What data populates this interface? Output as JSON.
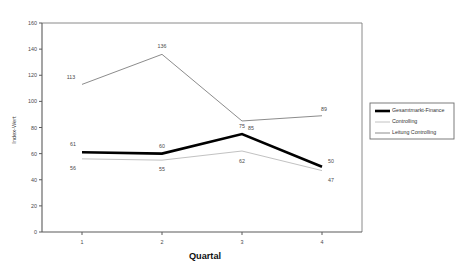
{
  "chart_data": {
    "type": "line",
    "title": "",
    "xlabel": "Quartal",
    "ylabel": "Index-Wert",
    "categories": [
      "1",
      "2",
      "3",
      "4"
    ],
    "x": [
      1,
      2,
      3,
      4
    ],
    "ylim": [
      0,
      160
    ],
    "xlim": [
      0.5,
      4.5
    ],
    "yticks": [
      "0",
      "20",
      "40",
      "60",
      "80",
      "100",
      "120",
      "140",
      "160"
    ],
    "ytick_values": [
      0,
      20,
      40,
      60,
      80,
      100,
      120,
      140,
      160
    ],
    "grid": false,
    "legend_position": "right",
    "series": [
      {
        "name": "Gesamtmarkt-Finance",
        "values": [
          61,
          60,
          75,
          50
        ],
        "labels": [
          "61",
          "60",
          "75",
          "50"
        ],
        "color": "#000000",
        "width": 2.6
      },
      {
        "name": "Controlling",
        "values": [
          56,
          55,
          62,
          47
        ],
        "labels": [
          "56",
          "55",
          "62",
          "47"
        ],
        "color": "#c2c2c2",
        "width": 1.0
      },
      {
        "name": "Leitung Controlling",
        "values": [
          113,
          136,
          85,
          89
        ],
        "labels": [
          "113",
          "136",
          "85",
          "89"
        ],
        "color": "#8c8c8c",
        "width": 1.0
      }
    ]
  },
  "legend": {
    "entries": [
      {
        "label": "Gesamtmarkt-Finance"
      },
      {
        "label": "Controlling"
      },
      {
        "label": "Leitung Controlling"
      }
    ]
  }
}
